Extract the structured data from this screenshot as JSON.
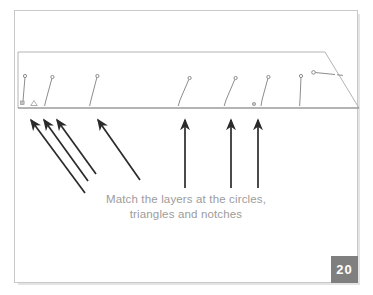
{
  "page": {
    "number_label": "20",
    "background_color": "#ffffff",
    "frame_color": "#c9c9c9"
  },
  "caption": {
    "line1": "Match the layers at the circles,",
    "line2": "triangles and notches",
    "color": "#9c9c9c"
  },
  "diagram": {
    "name": "layer-alignment-diagram",
    "shape": "parallelogram-panel",
    "outline_color": "#aaaaaa",
    "baseline_color": "#9a9a9a",
    "marker_color": "#8d8d8d",
    "arrow_color": "#2b2b2b",
    "panel": {
      "top_left_x": 18,
      "top_y": 52,
      "top_right_x": 325,
      "bottom_left_x": 18,
      "bottom_y": 108,
      "bottom_right_x": 359
    },
    "pin_markers": [
      {
        "name": "pin-square-1",
        "symbol": "square",
        "x": 22,
        "tip_x": 25,
        "tip_y": 76
      },
      {
        "name": "pin-triangle-1",
        "symbol": "triangle",
        "x": 34,
        "tip_x": 34,
        "tip_y": 104
      },
      {
        "name": "pin-notch-1",
        "symbol": "notch",
        "x": 47,
        "tip_x": 52,
        "tip_y": 77
      },
      {
        "name": "pin-notch-2",
        "symbol": "notch",
        "x": 92,
        "tip_x": 97,
        "tip_y": 76
      },
      {
        "name": "pin-notch-3",
        "symbol": "notch",
        "x": 180,
        "tip_x": 189,
        "tip_y": 78
      },
      {
        "name": "pin-notch-4",
        "symbol": "notch",
        "x": 226,
        "tip_x": 235,
        "tip_y": 78
      },
      {
        "name": "pin-circle-1",
        "symbol": "circle",
        "x": 258,
        "tip_x": 268,
        "tip_y": 77
      },
      {
        "name": "pin-notch-5",
        "symbol": "notch",
        "x": 300,
        "tip_x": 301,
        "tip_y": 76
      },
      {
        "name": "pin-horizontal",
        "symbol": "horizontal-pin",
        "x": 312,
        "tip_x": 335,
        "tip_y": 73
      }
    ],
    "arrows_diagonal": [
      {
        "name": "arrow-diagonal-1",
        "tip_x": 30,
        "tip_y": 118,
        "tail_x": 85,
        "tail_y": 193
      },
      {
        "name": "arrow-diagonal-2",
        "tip_x": 43,
        "tip_y": 118,
        "tail_x": 88,
        "tail_y": 181
      },
      {
        "name": "arrow-diagonal-3",
        "tip_x": 56,
        "tip_y": 118,
        "tail_x": 96,
        "tail_y": 174
      },
      {
        "name": "arrow-diagonal-4",
        "tip_x": 97,
        "tip_y": 118,
        "tail_x": 140,
        "tail_y": 180
      }
    ],
    "arrows_vertical": [
      {
        "name": "arrow-vertical-1",
        "x": 185,
        "tip_y": 118,
        "tail_y": 188
      },
      {
        "name": "arrow-vertical-2",
        "x": 231,
        "tip_y": 118,
        "tail_y": 188
      },
      {
        "name": "arrow-vertical-3",
        "x": 258,
        "tip_y": 118,
        "tail_y": 188
      }
    ]
  }
}
